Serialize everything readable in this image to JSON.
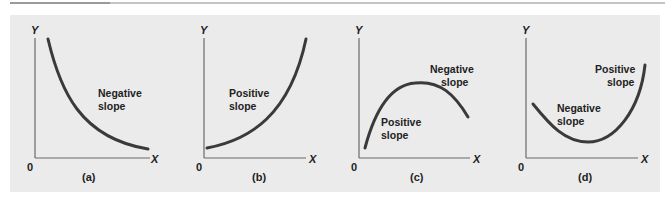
{
  "figure": {
    "panels": [
      {
        "id": "a",
        "caption": "(a)",
        "y_label": "Y",
        "x_label": "X",
        "origin_label": "0",
        "annotations": [
          {
            "line1": "Negative",
            "line2": "slope"
          }
        ],
        "shape": "decreasing convex curve"
      },
      {
        "id": "b",
        "caption": "(b)",
        "y_label": "Y",
        "x_label": "X",
        "origin_label": "0",
        "annotations": [
          {
            "line1": "Positive",
            "line2": "slope"
          }
        ],
        "shape": "increasing convex curve"
      },
      {
        "id": "c",
        "caption": "(c)",
        "y_label": "Y",
        "x_label": "X",
        "origin_label": "0",
        "annotations": [
          {
            "line1": "Negative",
            "line2": "slope"
          },
          {
            "line1": "Positive",
            "line2": "slope"
          }
        ],
        "shape": "inverted U (rises then falls)"
      },
      {
        "id": "d",
        "caption": "(d)",
        "y_label": "Y",
        "x_label": "X",
        "origin_label": "0",
        "annotations": [
          {
            "line1": "Positive",
            "line2": "slope"
          },
          {
            "line1": "Negative",
            "line2": "slope"
          }
        ],
        "shape": "U-shape (falls then rises)"
      }
    ],
    "colors": {
      "panel_background": "#ebebeb",
      "curve": "#3a3a3a",
      "axis": "#6a6a6a"
    }
  }
}
